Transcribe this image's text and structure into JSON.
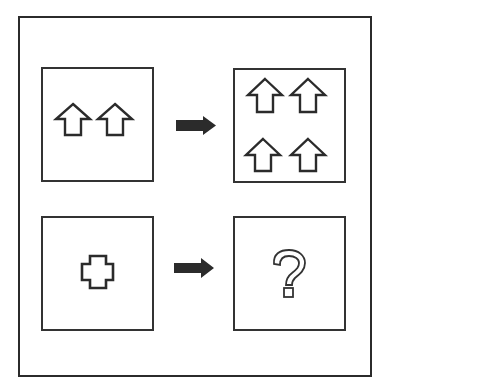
{
  "puzzle": {
    "type": "analogy",
    "colors": {
      "stroke": "#2b2b2b",
      "fill_arrow": "#2b2b2b",
      "background": "#ffffff"
    },
    "rows": [
      {
        "left_panel": {
          "shape": "up-arrow-outline",
          "count": 2
        },
        "connector": "right-arrow",
        "right_panel": {
          "shape": "up-arrow-outline",
          "count": 4
        }
      },
      {
        "left_panel": {
          "shape": "cross-outline",
          "count": 1
        },
        "connector": "right-arrow",
        "right_panel": {
          "shape": "question-mark",
          "text": "?"
        }
      }
    ]
  }
}
